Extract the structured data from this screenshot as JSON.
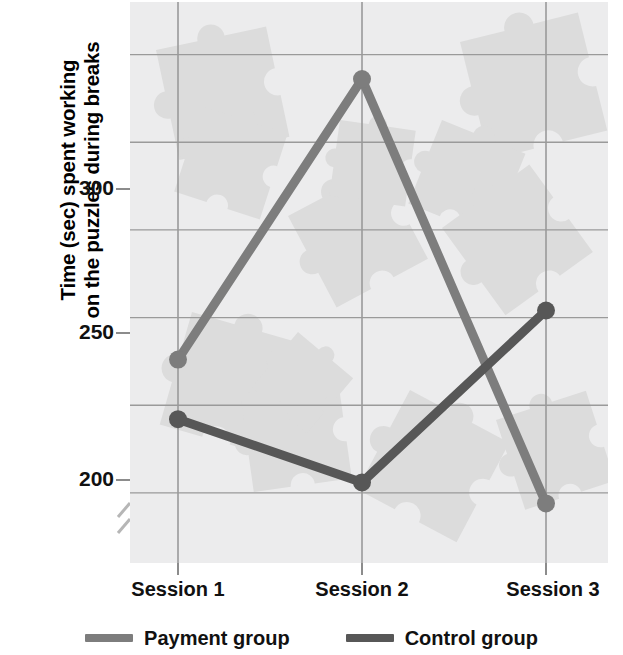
{
  "chart_data": {
    "type": "line",
    "title": "",
    "subtitle": "",
    "xlabel": "",
    "ylabel": "Time (sec) spent working on the puzzles during breaks",
    "ylabel_lines": [
      "Time (sec) spent working",
      "on the puzzles during breaks"
    ],
    "categories": [
      "Session 1",
      "Session 2",
      "Session 3"
    ],
    "series": [
      {
        "name": "Payment group",
        "values": [
          238,
          318,
          197
        ],
        "color": "#7d7d7d"
      },
      {
        "name": "Control group",
        "values": [
          221,
          203,
          252
        ],
        "color": "#575757"
      }
    ],
    "ylim": [
      180,
      340
    ],
    "ytick_labels": [
      "200",
      "250",
      "300"
    ],
    "ytick_values": [
      200,
      250,
      300
    ],
    "minor_gridline_values": [
      225,
      275,
      325
    ],
    "grid": true,
    "legend_position": "bottom",
    "axis_break": true,
    "plot_background": "#ececed",
    "gridline_color": "#9a9a9a",
    "watermark": "puzzle-pieces"
  },
  "axis": {
    "y_title_line1": "Time (sec) spent working",
    "y_title_line2": "on the puzzles during breaks",
    "y_tick_200": "200",
    "y_tick_250": "250",
    "y_tick_300": "300",
    "x_tick_1": "Session 1",
    "x_tick_2": "Session 2",
    "x_tick_3": "Session 3"
  },
  "legend": {
    "items": [
      {
        "label": "Payment group",
        "color": "#7d7d7d"
      },
      {
        "label": "Control group",
        "color": "#575757"
      }
    ]
  }
}
